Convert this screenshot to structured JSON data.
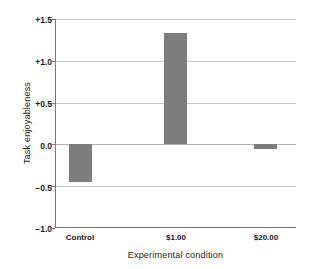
{
  "chart_data": {
    "type": "bar",
    "title": "",
    "subtitle": "",
    "xlabel": "Experimental condition",
    "ylabel": "Task enjoyableness",
    "categories": [
      "Control",
      "$1.00",
      "$20.00"
    ],
    "values": [
      -0.45,
      1.33,
      -0.05
    ],
    "series": [
      {
        "name": "Task enjoyableness",
        "values": [
          -0.45,
          1.33,
          -0.05
        ]
      }
    ],
    "ylim": [
      -1.0,
      1.5
    ],
    "yticks": [
      1.5,
      1.0,
      0.5,
      0.0,
      -0.5,
      -1.0
    ],
    "ytick_labels": [
      "+1.5",
      "+1.0",
      "+0.5",
      "0.0",
      "−0.5",
      "−1.0"
    ],
    "grid": true,
    "legend": "none",
    "bar_color": "#7d7d7d",
    "grid_color": "#c9c9c9",
    "axis_color": "#7a7a7a",
    "text_color": "#1a1a1a"
  },
  "axes": {
    "y_title": "Task enjoyableness",
    "x_title": "Experimental condition"
  },
  "y_labels": {
    "t0": "+1.5",
    "t1": "+1.0",
    "t2": "+0.5",
    "t3": "0.0",
    "t4": "−0.5",
    "t5": "−1.0"
  },
  "x_labels": {
    "c0": "Control",
    "c1": "$1.00",
    "c2": "$20.00"
  }
}
